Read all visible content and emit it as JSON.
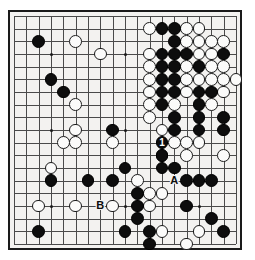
{
  "board": {
    "title": "Go board diagram",
    "size": 19,
    "visible_columns": [
      1,
      19
    ],
    "visible_rows": [
      1,
      19
    ],
    "colors": {
      "paper": "#f3f2f0",
      "line": "#4a4a4a",
      "frame": "#1a1a1a",
      "black_stone": "#0d0d0d",
      "white_stone": "#fbfbfa"
    },
    "star_points": [
      {
        "col": 4,
        "row": 4
      },
      {
        "col": 10,
        "row": 4
      },
      {
        "col": 16,
        "row": 4
      },
      {
        "col": 4,
        "row": 10
      },
      {
        "col": 10,
        "row": 10
      },
      {
        "col": 16,
        "row": 10
      },
      {
        "col": 4,
        "row": 16
      },
      {
        "col": 10,
        "row": 16
      },
      {
        "col": 16,
        "row": 16
      }
    ],
    "black_stones": [
      {
        "col": 3,
        "row": 3
      },
      {
        "col": 4,
        "row": 6
      },
      {
        "col": 5,
        "row": 7
      },
      {
        "col": 13,
        "row": 2
      },
      {
        "col": 14,
        "row": 2
      },
      {
        "col": 14,
        "row": 3
      },
      {
        "col": 13,
        "row": 4
      },
      {
        "col": 14,
        "row": 4
      },
      {
        "col": 15,
        "row": 4
      },
      {
        "col": 18,
        "row": 4
      },
      {
        "col": 13,
        "row": 5
      },
      {
        "col": 14,
        "row": 5
      },
      {
        "col": 16,
        "row": 5
      },
      {
        "col": 13,
        "row": 6
      },
      {
        "col": 14,
        "row": 6
      },
      {
        "col": 13,
        "row": 7
      },
      {
        "col": 14,
        "row": 7
      },
      {
        "col": 16,
        "row": 7
      },
      {
        "col": 17,
        "row": 7
      },
      {
        "col": 13,
        "row": 8
      },
      {
        "col": 16,
        "row": 8
      },
      {
        "col": 14,
        "row": 9
      },
      {
        "col": 16,
        "row": 9
      },
      {
        "col": 18,
        "row": 9
      },
      {
        "col": 9,
        "row": 10
      },
      {
        "col": 14,
        "row": 10
      },
      {
        "col": 16,
        "row": 10
      },
      {
        "col": 18,
        "row": 10
      },
      {
        "col": 13,
        "row": 11
      },
      {
        "col": 13,
        "row": 12
      },
      {
        "col": 13,
        "row": 13
      },
      {
        "col": 14,
        "row": 13
      },
      {
        "col": 15,
        "row": 14
      },
      {
        "col": 16,
        "row": 14
      },
      {
        "col": 17,
        "row": 14
      },
      {
        "col": 4,
        "row": 14
      },
      {
        "col": 7,
        "row": 14
      },
      {
        "col": 9,
        "row": 14
      },
      {
        "col": 10,
        "row": 13
      },
      {
        "col": 11,
        "row": 15
      },
      {
        "col": 11,
        "row": 16
      },
      {
        "col": 11,
        "row": 17
      },
      {
        "col": 15,
        "row": 16
      },
      {
        "col": 17,
        "row": 17
      },
      {
        "col": 10,
        "row": 18
      },
      {
        "col": 12,
        "row": 18
      },
      {
        "col": 18,
        "row": 18
      },
      {
        "col": 3,
        "row": 18
      },
      {
        "col": 12,
        "row": 19
      }
    ],
    "white_stones": [
      {
        "col": 6,
        "row": 3
      },
      {
        "col": 8,
        "row": 4
      },
      {
        "col": 17,
        "row": 3
      },
      {
        "col": 12,
        "row": 2
      },
      {
        "col": 15,
        "row": 2
      },
      {
        "col": 16,
        "row": 2
      },
      {
        "col": 15,
        "row": 3
      },
      {
        "col": 16,
        "row": 3
      },
      {
        "col": 18,
        "row": 3
      },
      {
        "col": 12,
        "row": 4
      },
      {
        "col": 16,
        "row": 4
      },
      {
        "col": 17,
        "row": 4
      },
      {
        "col": 12,
        "row": 5
      },
      {
        "col": 15,
        "row": 5
      },
      {
        "col": 17,
        "row": 5
      },
      {
        "col": 18,
        "row": 5
      },
      {
        "col": 12,
        "row": 6
      },
      {
        "col": 15,
        "row": 6
      },
      {
        "col": 16,
        "row": 6
      },
      {
        "col": 17,
        "row": 6
      },
      {
        "col": 18,
        "row": 6
      },
      {
        "col": 19,
        "row": 6
      },
      {
        "col": 12,
        "row": 7
      },
      {
        "col": 15,
        "row": 7
      },
      {
        "col": 18,
        "row": 7
      },
      {
        "col": 12,
        "row": 8
      },
      {
        "col": 14,
        "row": 8
      },
      {
        "col": 17,
        "row": 8
      },
      {
        "col": 6,
        "row": 8
      },
      {
        "col": 12,
        "row": 9
      },
      {
        "col": 6,
        "row": 10
      },
      {
        "col": 5,
        "row": 11
      },
      {
        "col": 6,
        "row": 11
      },
      {
        "col": 9,
        "row": 11
      },
      {
        "col": 13,
        "row": 10
      },
      {
        "col": 14,
        "row": 11
      },
      {
        "col": 15,
        "row": 11
      },
      {
        "col": 16,
        "row": 11
      },
      {
        "col": 13,
        "row": 12
      },
      {
        "col": 15,
        "row": 12
      },
      {
        "col": 18,
        "row": 12
      },
      {
        "col": 4,
        "row": 13
      },
      {
        "col": 3,
        "row": 16
      },
      {
        "col": 6,
        "row": 16
      },
      {
        "col": 9,
        "row": 16
      },
      {
        "col": 11,
        "row": 14
      },
      {
        "col": 12,
        "row": 15
      },
      {
        "col": 13,
        "row": 15
      },
      {
        "col": 12,
        "row": 16
      },
      {
        "col": 13,
        "row": 18
      },
      {
        "col": 16,
        "row": 18
      },
      {
        "col": 15,
        "row": 19
      }
    ],
    "numbered_moves": [
      {
        "label": "1",
        "col": 13,
        "row": 11,
        "color": "black"
      },
      {
        "label": "2",
        "col": 13,
        "row": 12,
        "color": "white"
      }
    ],
    "point_labels": [
      {
        "label": "A",
        "col": 14,
        "row": 14
      },
      {
        "label": "B",
        "col": 8,
        "row": 16
      }
    ]
  }
}
